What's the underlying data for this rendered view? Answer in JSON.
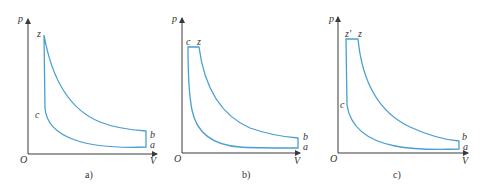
{
  "colors": {
    "cycle_line": "#4a9fd0",
    "axis": "#3a3a3a",
    "text": "#333333",
    "background": "#ffffff"
  },
  "diagrams": [
    {
      "id": "a",
      "caption": "a)",
      "axis_y_label": "p",
      "axis_x_label": "V",
      "origin_label": "O",
      "cycle": "constant-volume heat addition (Otto)",
      "points": {
        "z": "z",
        "c": "c",
        "b": "b",
        "a": "a"
      }
    },
    {
      "id": "b",
      "caption": "b)",
      "axis_y_label": "p",
      "axis_x_label": "V",
      "origin_label": "O",
      "cycle": "constant-pressure heat addition (Diesel)",
      "points": {
        "c": "c",
        "z": "z",
        "b": "b",
        "a": "a"
      }
    },
    {
      "id": "c",
      "caption": "c)",
      "axis_y_label": "p",
      "axis_x_label": "V",
      "origin_label": "O",
      "cycle": "mixed heat addition (Sabathé)",
      "points": {
        "z_prime": "z'",
        "z": "z",
        "c": "c",
        "b": "b",
        "a": "a"
      }
    }
  ]
}
